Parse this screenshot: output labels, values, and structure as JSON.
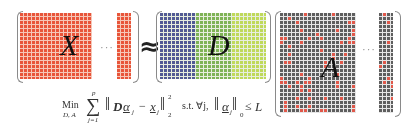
{
  "diagram": {
    "matrices": {
      "X": {
        "label": "X",
        "color": "#e8553a",
        "grid_line_color": "#f6c7b8",
        "ellipsis": "···"
      },
      "approx_symbol": "≈",
      "D": {
        "label": "D",
        "colors": [
          "#525a94",
          "#7fb356",
          "#bfd95a"
        ],
        "grid_line_color": "#e8eedf"
      },
      "A": {
        "label": "A",
        "base_color": "#5e5e5e",
        "nonzero_color": "#e0584a",
        "grid_line_color": "#e6e6e6",
        "ellipsis": "···"
      }
    },
    "formula": {
      "min": "Min",
      "min_sub": "D, A",
      "sum_symbol": "∑",
      "sum_upper": "p",
      "sum_lower": "j=1",
      "norm_open": "‖",
      "term_D": "D",
      "term_alpha": "α",
      "alpha_sub": "j",
      "minus": "−",
      "term_x": "x",
      "x_sub": "j",
      "norm_close": "‖",
      "sup": "2",
      "sub": "2",
      "st": "s.t. ∀j,",
      "norm2_open": "‖",
      "alpha2": "α",
      "alpha2_sub": "j",
      "norm2_close": "‖",
      "norm2_sub": "0",
      "leq": "≤",
      "bound": "L"
    }
  }
}
